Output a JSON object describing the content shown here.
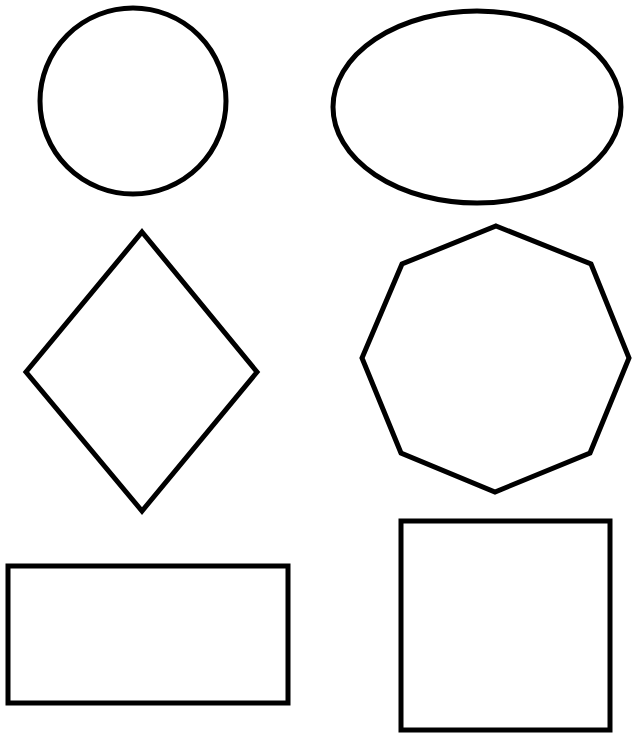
{
  "worksheet": {
    "background": "#ffffff",
    "stroke_color": "#000000",
    "stroke_width": 5,
    "shapes": [
      {
        "name": "circle",
        "type": "circle",
        "cx": 133,
        "cy": 101,
        "r": 93
      },
      {
        "name": "oval",
        "type": "ellipse",
        "cx": 477,
        "cy": 107,
        "rx": 144,
        "ry": 96
      },
      {
        "name": "diamond",
        "type": "polygon",
        "points": "142,232 257,372 142,511 26,372"
      },
      {
        "name": "octagon",
        "type": "polygon",
        "points": "496,226 591,264 629,358 590,453 495,492 401,453 362,358 402,264"
      },
      {
        "name": "rectangle",
        "type": "rect",
        "x": 8,
        "y": 566,
        "width": 280,
        "height": 137
      },
      {
        "name": "square",
        "type": "rect",
        "x": 401,
        "y": 521,
        "width": 209,
        "height": 209
      }
    ]
  }
}
